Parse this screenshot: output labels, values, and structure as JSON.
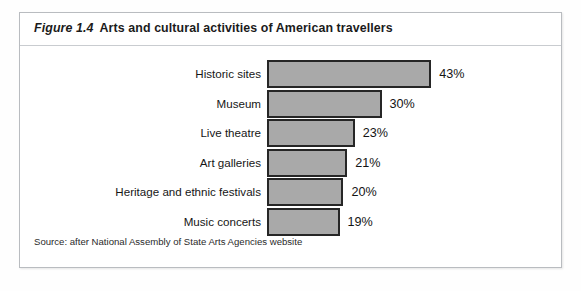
{
  "figure": {
    "number": "Figure 1.4",
    "title": "Arts and cultural activities of American travellers",
    "source": "Source: after National Assembly of State Arts Agencies website"
  },
  "chart_data": {
    "type": "bar",
    "orientation": "horizontal",
    "title": "Arts and cultural activities of American travellers",
    "xlabel": "",
    "ylabel": "",
    "xlim": [
      0,
      45
    ],
    "grid": false,
    "legend": null,
    "value_suffix": "%",
    "categories": [
      "Historic sites",
      "Museum",
      "Live theatre",
      "Art galleries",
      "Heritage and ethnic festivals",
      "Music concerts"
    ],
    "values": [
      43,
      30,
      23,
      21,
      20,
      19
    ],
    "value_labels": [
      "43%",
      "30%",
      "23%",
      "21%",
      "20%",
      "19%"
    ],
    "bar_fill": "#a9a9a9",
    "bar_border": "#262626"
  },
  "bars": [
    {
      "label": "Historic sites",
      "value": 43,
      "value_label": "43%"
    },
    {
      "label": "Museum",
      "value": 30,
      "value_label": "30%"
    },
    {
      "label": "Live theatre",
      "value": 23,
      "value_label": "23%"
    },
    {
      "label": "Art galleries",
      "value": 21,
      "value_label": "21%"
    },
    {
      "label": "Heritage and ethnic festivals",
      "value": 20,
      "value_label": "20%"
    },
    {
      "label": "Music concerts",
      "value": 19,
      "value_label": "19%"
    }
  ]
}
